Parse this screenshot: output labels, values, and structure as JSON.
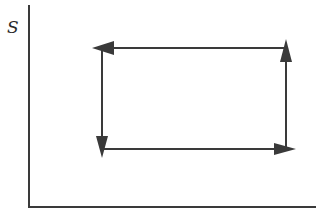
{
  "diagram": {
    "type": "process-cycle",
    "axes": {
      "y_label": "S",
      "x_label": ""
    },
    "cycle": {
      "direction": "counterclockwise",
      "corners": [
        {
          "name": "bottom-left",
          "x": 102,
          "y": 149
        },
        {
          "name": "bottom-right",
          "x": 286,
          "y": 149
        },
        {
          "name": "top-right",
          "x": 286,
          "y": 48
        },
        {
          "name": "top-left",
          "x": 102,
          "y": 48
        }
      ],
      "segments": [
        {
          "name": "bottom",
          "from": "bottom-left",
          "to": "bottom-right",
          "arrow": "right"
        },
        {
          "name": "right",
          "from": "bottom-right",
          "to": "top-right",
          "arrow": "up"
        },
        {
          "name": "top",
          "from": "top-right",
          "to": "top-left",
          "arrow": "left"
        },
        {
          "name": "left",
          "from": "top-left",
          "to": "bottom-left",
          "arrow": "down"
        }
      ]
    },
    "colors": {
      "line": "#3a3a3a",
      "background": "#ffffff"
    }
  }
}
